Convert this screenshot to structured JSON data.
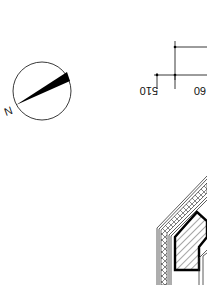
{
  "drawing": {
    "orientation": "rotated-180",
    "north_arrow": {
      "label": "N",
      "center": [
        42,
        91
      ],
      "radius": 29
    },
    "dimensions": [
      {
        "label": "510",
        "x": 163,
        "y": 82
      },
      {
        "label": "60",
        "x": 196,
        "y": 82
      }
    ],
    "wall_section": {
      "description": "hatched multi-layer wall corner with insulation layer and thick outline"
    },
    "colors": {
      "line": "#111111",
      "background": "#ffffff"
    }
  }
}
